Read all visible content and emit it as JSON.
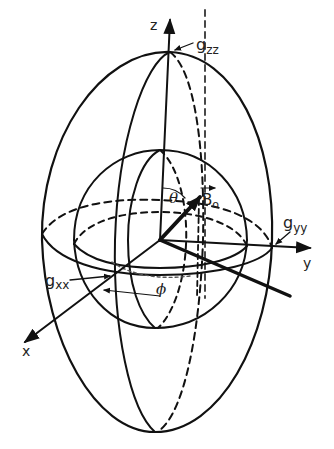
{
  "diagram": {
    "type": "g-tensor ellipsoid with field orientation",
    "axes": {
      "x": "x",
      "y": "y",
      "z": "z"
    },
    "principal_values": {
      "gxx": {
        "base": "g",
        "sub": "xx"
      },
      "gyy": {
        "base": "g",
        "sub": "yy"
      },
      "gzz": {
        "base": "g",
        "sub": "zz"
      }
    },
    "angles": {
      "theta": "θ",
      "phi": "ϕ"
    },
    "field": {
      "base": "B",
      "sub": "o"
    },
    "colors": {
      "stroke": "#111111",
      "text": "#222222",
      "background": "#ffffff"
    }
  }
}
